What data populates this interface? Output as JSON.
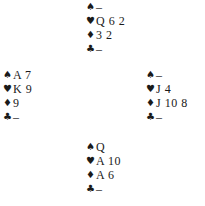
{
  "suit_symbols": {
    "spades": "♠",
    "hearts": "♥",
    "diamonds": "♦",
    "clubs": "♣"
  },
  "hands": {
    "north": {
      "spades": "–",
      "hearts": "Q 6 2",
      "diamonds": "3 2",
      "clubs": "–"
    },
    "west": {
      "spades": "A 7",
      "hearts": "K 9",
      "diamonds": "9",
      "clubs": "–"
    },
    "east": {
      "spades": "–",
      "hearts": "J 4",
      "diamonds": "J 10 8",
      "clubs": "–"
    },
    "south": {
      "spades": "Q",
      "hearts": "A 10",
      "diamonds": "A 6",
      "clubs": "–"
    }
  }
}
